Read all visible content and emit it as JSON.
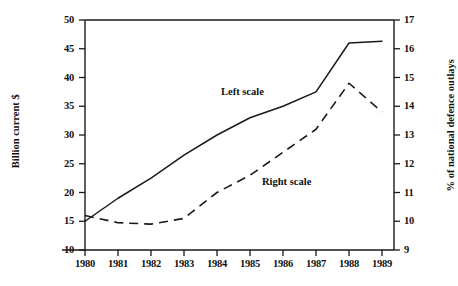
{
  "chart_data": {
    "type": "line",
    "title": "",
    "xlabel": "",
    "categories": [
      "1980",
      "1981",
      "1982",
      "1983",
      "1984",
      "1985",
      "1986",
      "1987",
      "1988",
      "1989"
    ],
    "x": [
      1980,
      1981,
      1982,
      1983,
      1984,
      1985,
      1986,
      1987,
      1988,
      1989
    ],
    "grid": false,
    "legend_position": "inline-annotations",
    "axes": {
      "left": {
        "label": "Billion current $",
        "min": 10,
        "max": 50,
        "tick_step": 5,
        "ticks": [
          "50",
          "45",
          "40",
          "35",
          "30",
          "25",
          "20",
          "15",
          "10"
        ]
      },
      "right": {
        "label": "% of national defence outlays",
        "min": 9,
        "max": 17,
        "tick_step": 1,
        "ticks": [
          "17",
          "16",
          "15",
          "14",
          "13",
          "12",
          "11",
          "10",
          "9"
        ]
      },
      "bottom": {
        "label": "",
        "ticks": [
          "1980",
          "1981",
          "1982",
          "1983",
          "1984",
          "1985",
          "1986",
          "1987",
          "1988",
          "1989"
        ]
      }
    },
    "series": [
      {
        "name": "Left scale",
        "axis": "left",
        "style": "solid",
        "color": "#1a1a1a",
        "annotation": "Left scale",
        "values": [
          15.0,
          19.0,
          22.5,
          26.5,
          30.0,
          33.0,
          35.0,
          37.5,
          46.0,
          46.3
        ]
      },
      {
        "name": "Right scale",
        "axis": "right",
        "style": "dashed",
        "color": "#1a1a1a",
        "annotation": "Right scale",
        "values": [
          10.2,
          9.95,
          9.9,
          10.1,
          11.0,
          11.6,
          12.4,
          13.2,
          14.8,
          13.8
        ]
      }
    ]
  }
}
